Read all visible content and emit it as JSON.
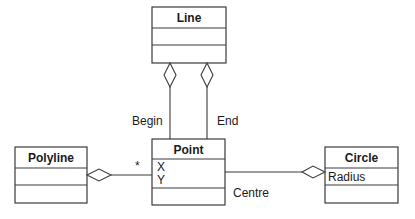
{
  "diagram": {
    "type": "UML class diagram",
    "classes": {
      "line": {
        "name": "Line",
        "attributes": [],
        "operations": []
      },
      "point": {
        "name": "Point",
        "attributes": [
          "X",
          "Y"
        ],
        "operations": []
      },
      "polyline": {
        "name": "Polyline",
        "attributes": [],
        "operations": []
      },
      "circle": {
        "name": "Circle",
        "attributes": [
          "Radius"
        ],
        "operations": []
      }
    },
    "associations": [
      {
        "from": "Line",
        "to": "Point",
        "kind": "aggregation",
        "role": "Begin"
      },
      {
        "from": "Line",
        "to": "Point",
        "kind": "aggregation",
        "role": "End"
      },
      {
        "from": "Polyline",
        "to": "Point",
        "kind": "aggregation",
        "multiplicity": "*"
      },
      {
        "from": "Circle",
        "to": "Point",
        "kind": "aggregation",
        "role": "Centre"
      }
    ],
    "labels": {
      "begin": "Begin",
      "end": "End",
      "many": "*",
      "centre": "Centre"
    }
  }
}
